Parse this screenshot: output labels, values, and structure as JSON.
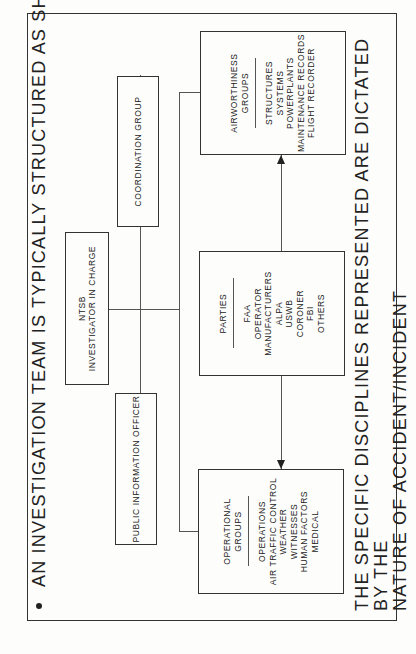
{
  "title": "AN INVESTIGATION TEAM IS TYPICALLY STRUCTURED AS SHOWN",
  "bullet_icon": "bullet-dot",
  "nodes": {
    "ntsb": {
      "line1": "NTSB",
      "line2": "INVESTIGATOR IN CHARGE"
    },
    "pio": {
      "label": "PUBLIC INFORMATION OFFICER"
    },
    "coordination": {
      "label": "COORDINATION GROUP"
    },
    "operational": {
      "heading1": "OPERATIONAL",
      "heading2": "GROUPS",
      "items": [
        "OPERATIONS",
        "AIR TRAFFIC CONTROL",
        "WEATHER",
        "WITNESSES",
        "HUMAN FACTORS",
        "MEDICAL"
      ]
    },
    "parties": {
      "heading1": "PARTIES",
      "items": [
        "FAA",
        "OPERATOR",
        "MANUFACTURERS",
        "ALPA",
        "USWB",
        "CORONER",
        "FBI",
        "OTHERS"
      ]
    },
    "airworthiness": {
      "heading1": "AIRWORTHINESS",
      "heading2": "GROUPS",
      "items": [
        "STRUCTURES",
        "SYSTEMS",
        "POWERPLANTS",
        "MAINTENANCE RECORDS",
        "FLIGHT RECORDER"
      ]
    }
  },
  "footer": {
    "line1": "THE SPECIFIC DISCIPLINES REPRESENTED ARE DICTATED BY THE",
    "line2": "NATURE OF ACCIDENT/INCIDENT"
  },
  "orientation": "rotated 90 degrees counter-clockwise"
}
